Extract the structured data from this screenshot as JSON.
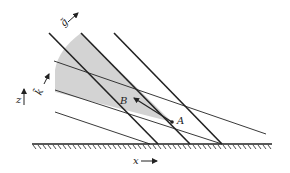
{
  "diagram": {
    "labels": {
      "point_a": "A",
      "point_b": "B",
      "x_axis": "x",
      "z_axis": "z",
      "vector_g": "g̃",
      "vector_k": "k̃"
    },
    "colors": {
      "ink": "#222222",
      "shade": "#d3d3d3",
      "background": "#ffffff"
    },
    "elements": {
      "ground": "hatched-boundary",
      "thick_lines": 3,
      "thin_lines": 3,
      "shaded_region": "wedge-from-A"
    }
  }
}
